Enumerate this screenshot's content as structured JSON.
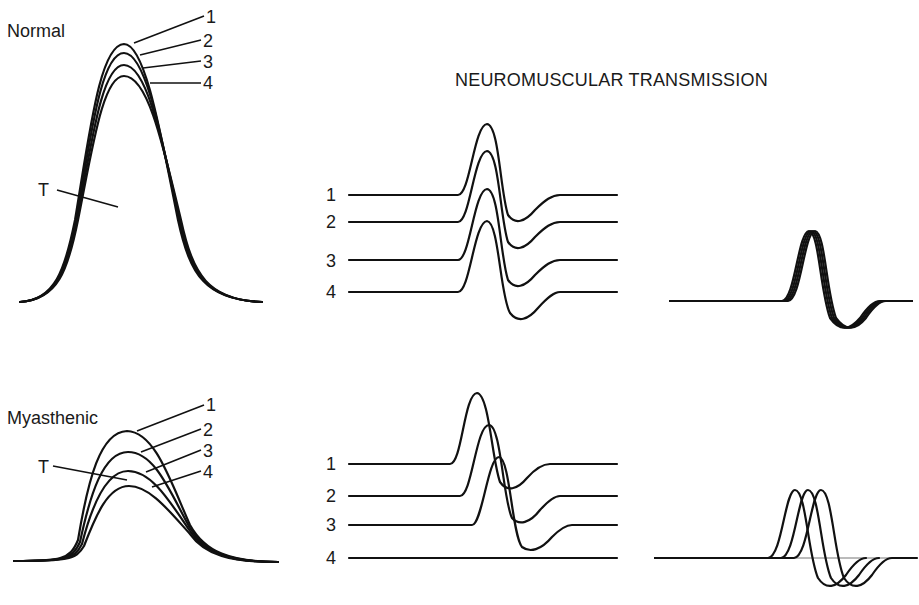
{
  "title": "NEUROMUSCULAR TRANSMISSION",
  "panels": {
    "normal": {
      "label": "Normal",
      "tension_label": "T",
      "curve_labels": [
        "1",
        "2",
        "3",
        "4"
      ],
      "ap_labels": [
        "1",
        "2",
        "3",
        "4"
      ]
    },
    "myasthenic": {
      "label": "Myasthenic",
      "tension_label": "T",
      "curve_labels": [
        "1",
        "2",
        "3",
        "4"
      ],
      "ap_labels": [
        "1",
        "2",
        "3",
        "4"
      ]
    }
  }
}
